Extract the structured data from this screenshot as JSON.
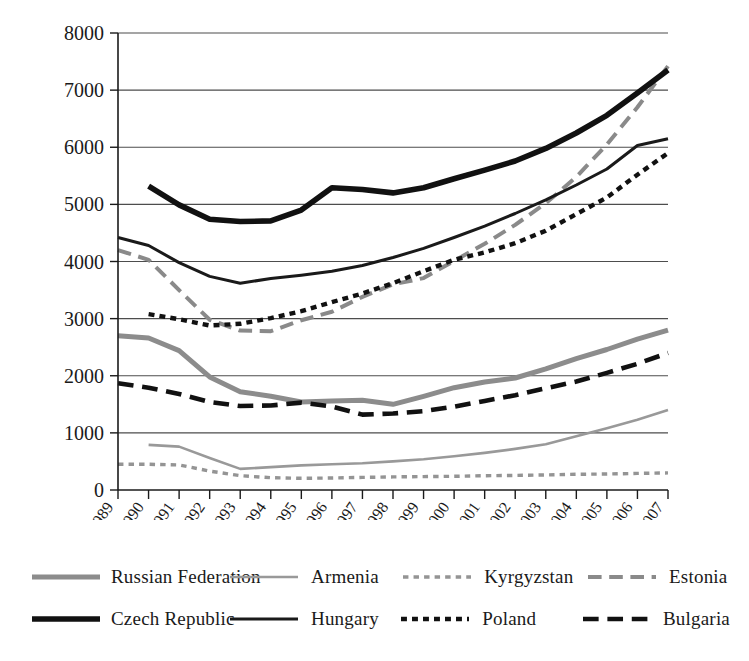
{
  "chart_data": {
    "type": "line",
    "title": "",
    "xlabel": "",
    "ylabel": "",
    "ylim": [
      0,
      8000
    ],
    "yticks": [
      0,
      1000,
      2000,
      3000,
      4000,
      5000,
      6000,
      7000,
      8000
    ],
    "grid": true,
    "legend_position": "bottom",
    "categories": [
      "1989",
      "1990",
      "1991",
      "1992",
      "1993",
      "1994",
      "1995",
      "1996",
      "1997",
      "1998",
      "1999",
      "2000",
      "2001",
      "2002",
      "2003",
      "2004",
      "2005",
      "2006",
      "2007"
    ],
    "series": [
      {
        "name": "Russian Federation",
        "style": "solid",
        "color": "#8c8c8c",
        "width": 5,
        "values": [
          2700,
          2660,
          2440,
          1980,
          1720,
          1640,
          1540,
          1560,
          1570,
          1500,
          1640,
          1790,
          1890,
          1960,
          2120,
          2300,
          2460,
          2640,
          2800
        ]
      },
      {
        "name": "Armenia",
        "style": "solid",
        "color": "#999999",
        "width": 2.6,
        "values": [
          null,
          790,
          760,
          560,
          370,
          400,
          430,
          450,
          470,
          500,
          540,
          590,
          650,
          720,
          800,
          940,
          1080,
          1230,
          1400
        ]
      },
      {
        "name": "Kyrgyzstan",
        "style": "fine-dashed",
        "color": "#949494",
        "width": 3.4,
        "values": [
          450,
          450,
          440,
          330,
          250,
          215,
          205,
          210,
          220,
          230,
          235,
          240,
          250,
          255,
          265,
          275,
          280,
          290,
          300
        ]
      },
      {
        "name": "Estonia",
        "style": "long-dashed",
        "color": "#8a8a8a",
        "width": 4,
        "values": [
          4200,
          4030,
          3500,
          2980,
          2790,
          2780,
          2970,
          3120,
          3380,
          3600,
          3710,
          4010,
          4310,
          4640,
          5020,
          5480,
          6050,
          6700,
          7420
        ]
      },
      {
        "name": "Czech Republic",
        "style": "solid",
        "color": "#111111",
        "width": 5.6,
        "values": [
          null,
          5320,
          4990,
          4740,
          4700,
          4710,
          4900,
          5290,
          5260,
          5200,
          5290,
          5450,
          5600,
          5760,
          5980,
          6250,
          6560,
          6950,
          7350
        ]
      },
      {
        "name": "Hungary",
        "style": "solid",
        "color": "#1a1a1a",
        "width": 3,
        "values": [
          4420,
          4280,
          3980,
          3740,
          3620,
          3700,
          3760,
          3830,
          3930,
          4070,
          4230,
          4420,
          4620,
          4840,
          5080,
          5340,
          5620,
          6030,
          6150
        ]
      },
      {
        "name": "Poland",
        "style": "dotted-thick",
        "color": "#111111",
        "width": 4.4,
        "values": [
          null,
          3080,
          2990,
          2880,
          2910,
          3010,
          3130,
          3290,
          3440,
          3620,
          3830,
          4030,
          4160,
          4320,
          4540,
          4830,
          5120,
          5520,
          5900
        ]
      },
      {
        "name": "Bulgaria",
        "style": "long-dashed",
        "color": "#111111",
        "width": 4.6,
        "values": [
          1870,
          1790,
          1680,
          1540,
          1470,
          1480,
          1530,
          1460,
          1320,
          1340,
          1380,
          1460,
          1560,
          1660,
          1780,
          1900,
          2050,
          2210,
          2400
        ]
      }
    ]
  },
  "legend": {
    "rows": [
      [
        "Russian Federation",
        "Armenia",
        "Kyrgyzstan",
        "Estonia"
      ],
      [
        "Czech Republic",
        "Hungary",
        "Poland",
        "Bulgaria"
      ]
    ]
  }
}
